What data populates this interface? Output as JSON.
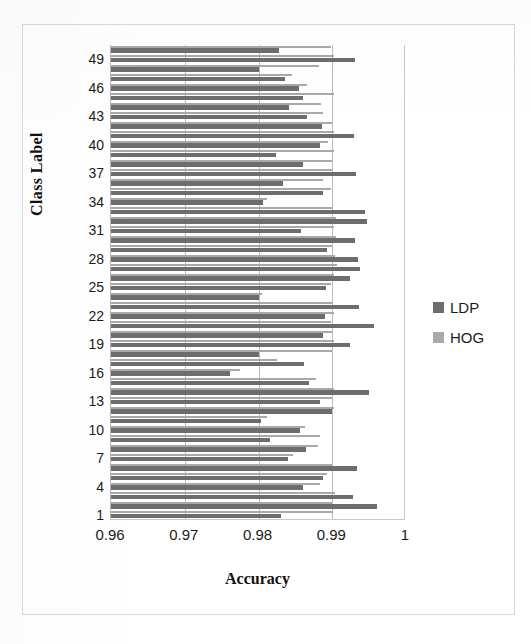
{
  "chart_data": {
    "type": "bar",
    "orientation": "horizontal",
    "title": "",
    "xlabel": "Accuracy",
    "ylabel": "Class Label",
    "xlim": [
      0.96,
      1.0
    ],
    "xticks": [
      "0.96",
      "0.97",
      "0.98",
      "0.99",
      "1"
    ],
    "xtick_values": [
      0.96,
      0.97,
      0.98,
      0.99,
      1.0
    ],
    "yticks": [
      "1",
      "4",
      "7",
      "10",
      "13",
      "16",
      "19",
      "22",
      "25",
      "28",
      "31",
      "34",
      "37",
      "40",
      "43",
      "46",
      "49"
    ],
    "ytick_values": [
      1,
      4,
      7,
      10,
      13,
      16,
      19,
      22,
      25,
      28,
      31,
      34,
      37,
      40,
      43,
      46,
      49
    ],
    "grid": "vertical",
    "legend_position": "right",
    "categories": [
      1,
      2,
      3,
      4,
      5,
      6,
      7,
      8,
      9,
      10,
      11,
      12,
      13,
      14,
      15,
      16,
      17,
      18,
      19,
      20,
      21,
      22,
      23,
      24,
      25,
      26,
      27,
      28,
      29,
      30,
      31,
      32,
      33,
      34,
      35,
      36,
      37,
      38,
      39,
      40,
      41,
      42,
      43,
      44,
      45,
      46,
      47,
      48,
      49,
      50
    ],
    "series": [
      {
        "name": "LDP",
        "color": "#6d6d6d",
        "values": [
          0.983,
          0.996,
          0.9928,
          0.986,
          0.9888,
          0.9934,
          0.984,
          0.9865,
          0.9815,
          0.9856,
          0.9803,
          0.99,
          0.9884,
          0.995,
          0.9868,
          0.9761,
          0.9862,
          0.98,
          0.9924,
          0.9888,
          0.9957,
          0.989,
          0.9936,
          0.9801,
          0.9892,
          0.9924,
          0.9937,
          0.9935,
          0.9893,
          0.9931,
          0.9858,
          0.9947,
          0.9945,
          0.9806,
          0.9888,
          0.9833,
          0.9932,
          0.986,
          0.9824,
          0.9884,
          0.993,
          0.9886,
          0.9866,
          0.9842,
          0.9861,
          0.9855,
          0.9836,
          0.98,
          0.9931,
          0.9828
        ]
      },
      {
        "name": "HOG",
        "color": "#a9a9a9",
        "values": [
          0.9901,
          0.99,
          0.9904,
          0.9884,
          0.9893,
          0.99,
          0.9847,
          0.988,
          0.9884,
          0.9863,
          0.9811,
          0.9903,
          0.99,
          0.9902,
          0.9878,
          0.9775,
          0.9825,
          0.9899,
          0.9903,
          0.9899,
          0.9898,
          0.9903,
          0.9901,
          0.9805,
          0.9898,
          0.9902,
          0.9907,
          0.9904,
          0.9899,
          0.9905,
          0.9902,
          0.9905,
          0.99,
          0.9811,
          0.9898,
          0.9888,
          0.99,
          0.9899,
          0.9903,
          0.9894,
          0.9903,
          0.9899,
          0.9887,
          0.9885,
          0.9903,
          0.9866,
          0.9845,
          0.9882,
          0.9902,
          0.9898
        ]
      }
    ]
  },
  "legend": {
    "items": [
      {
        "label": "LDP",
        "color": "#6d6d6d"
      },
      {
        "label": "HOG",
        "color": "#a9a9a9"
      }
    ]
  },
  "axes": {
    "x_title": "Accuracy",
    "y_title": "Class Label"
  }
}
